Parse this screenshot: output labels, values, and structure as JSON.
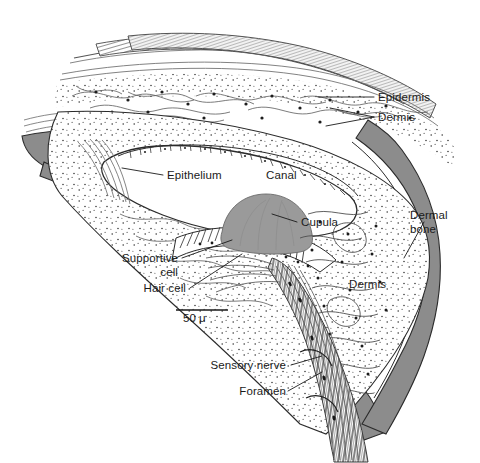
{
  "figure": {
    "background_color": "#ffffff",
    "ink_color": "#1a1a1a",
    "bone_fill": "#8f8f8f",
    "cupula_fill": "#9a9a9a",
    "tissue_fill": "#fdfdfd"
  },
  "labels": {
    "epidermis": "Epidermis",
    "dermis_top": "Dermis",
    "epithelium": "Epithelium",
    "canal": "Canal",
    "cupula": "Cupula",
    "dermal_bone_line1": "Dermal",
    "dermal_bone_line2": "bone",
    "supportive_line1": "Supportive",
    "supportive_line2": "cell",
    "hair_cell": "Hair cell",
    "dermis_mid": "Dermis",
    "sensory_nerve": "Sensory nerve",
    "foramen": "Foramen"
  },
  "scale_bar": {
    "value": "50",
    "unit": "μ",
    "text": "50 μ",
    "length_px": 52
  }
}
